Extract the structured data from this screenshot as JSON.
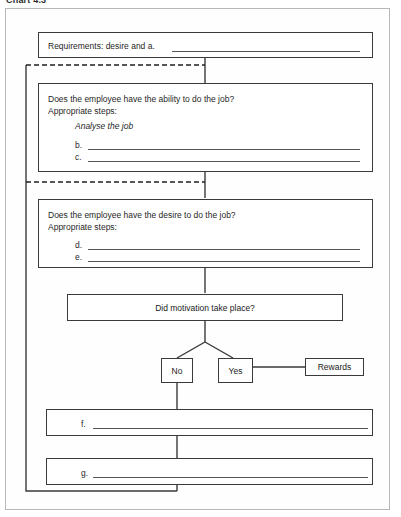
{
  "caption": "Chart 4.3",
  "diagram": {
    "boxes": {
      "requirements": {
        "label": "Requirements: desire and a.",
        "blank": true
      },
      "ability": {
        "question": "Does the employee have the ability to do the job?",
        "steps_label": "Appropriate steps:",
        "given_step": "Analyse the job",
        "items": [
          "b.",
          "c."
        ]
      },
      "desire": {
        "question": "Does the employee have the desire to do the job?",
        "steps_label": "Appropriate steps:",
        "items": [
          "d.",
          "e."
        ]
      },
      "motivation": {
        "question": "Did motivation take place?"
      },
      "no_branch": {
        "label": "No"
      },
      "yes_branch": {
        "label": "Yes"
      },
      "rewards": {
        "label": "Rewards"
      },
      "step_f": {
        "label": "f."
      },
      "step_g": {
        "label": "g."
      }
    },
    "connectors": {
      "feedback_loop_style": "solid",
      "branch_style": "dashed",
      "line_color": "#3a3a3a"
    }
  }
}
